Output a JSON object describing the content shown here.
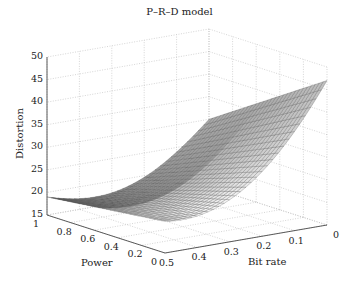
{
  "chart_data": {
    "type": "surface3d",
    "title": "P–R–D model",
    "xlabel": "Bit rate",
    "ylabel": "Power",
    "zlabel": "Distortion",
    "xlim": [
      0,
      0.5
    ],
    "ylim": [
      0,
      1
    ],
    "zlim": [
      15,
      50
    ],
    "x_ticks": [
      "0",
      "0.1",
      "0.2",
      "0.3",
      "0.4",
      "0.5"
    ],
    "y_ticks": [
      "0",
      "0.2",
      "0.4",
      "0.6",
      "0.8",
      "1"
    ],
    "z_ticks": [
      "15",
      "20",
      "25",
      "30",
      "35",
      "40",
      "45",
      "50"
    ],
    "grid": true,
    "colormap": "gray",
    "surface_samples": {
      "description": "Approximate distortion read from the surface: low at high bit rate / high power, high at low bit rate / low power",
      "corner_bitrate0.5_power1": 19,
      "corner_bitrate0.5_power0": 22,
      "corner_bitrate0_power1": 30,
      "corner_bitrate0_power0": 44
    }
  },
  "labels": {
    "title": "P–R–D model",
    "x": "Bit rate",
    "y": "Power",
    "z": "Distortion"
  }
}
